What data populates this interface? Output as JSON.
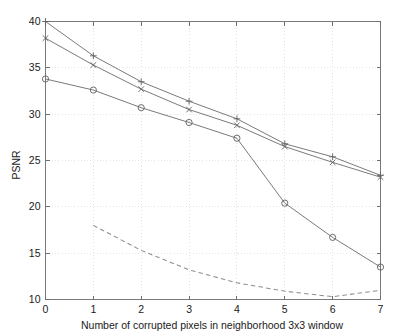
{
  "chart_data": {
    "type": "line",
    "title": "",
    "xlabel": "Number of corrupted pixels in neighborhood 3x3 window",
    "ylabel": "PSNR",
    "xlim": [
      0,
      7
    ],
    "ylim": [
      10,
      40
    ],
    "xticks": [
      0,
      1,
      2,
      3,
      4,
      5,
      6,
      7
    ],
    "xtick_labels": [
      "0",
      "1",
      "2",
      "3",
      "4",
      "5",
      "6",
      "7"
    ],
    "yticks": [
      10,
      15,
      20,
      25,
      30,
      35,
      40
    ],
    "ytick_labels": [
      "10",
      "15",
      "20",
      "25",
      "30",
      "35",
      "40"
    ],
    "grid": true,
    "legend": null,
    "legend_position": "none",
    "x": [
      0,
      1,
      2,
      3,
      4,
      5,
      6,
      7
    ],
    "series": [
      {
        "name": "series-plus",
        "marker": "plus",
        "linestyle": "solid",
        "color": "#6b6b6b",
        "x": [
          0,
          1,
          2,
          3,
          4,
          5,
          6,
          7
        ],
        "values": [
          40.0,
          36.3,
          33.5,
          31.4,
          29.5,
          26.8,
          25.4,
          23.4
        ]
      },
      {
        "name": "series-cross",
        "marker": "cross",
        "linestyle": "solid",
        "color": "#6b6b6b",
        "x": [
          0,
          1,
          2,
          3,
          4,
          5,
          6,
          7
        ],
        "values": [
          38.2,
          35.3,
          32.7,
          30.5,
          28.8,
          26.5,
          24.8,
          23.2
        ]
      },
      {
        "name": "series-circle",
        "marker": "circle",
        "linestyle": "solid",
        "color": "#6b6b6b",
        "x": [
          0,
          1,
          2,
          3,
          4,
          5,
          6,
          7
        ],
        "values": [
          33.8,
          32.6,
          30.7,
          29.1,
          27.4,
          20.4,
          16.7,
          13.5
        ]
      },
      {
        "name": "series-dashed",
        "marker": "none",
        "linestyle": "dashed",
        "color": "#8e8e8e",
        "x": [
          1,
          2,
          3,
          4,
          5,
          6,
          7
        ],
        "values": [
          18.0,
          15.3,
          13.2,
          11.8,
          10.9,
          10.3,
          11.0
        ]
      }
    ]
  },
  "colors": {
    "background": "#ffffff",
    "axis": "#7a7a7a",
    "grid": "#d8d8d8",
    "text": "#1a1a1a",
    "line": "#6b6b6b",
    "dashed_line": "#8e8e8e"
  }
}
